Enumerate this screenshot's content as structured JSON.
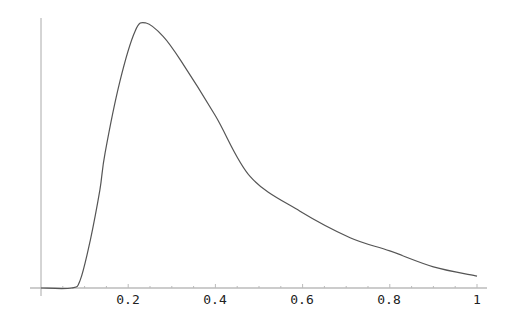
{
  "chart_data": {
    "type": "line",
    "title": "",
    "xlabel": "",
    "ylabel": "",
    "xlim": [
      0,
      1
    ],
    "ylim": [
      0,
      1
    ],
    "grid": false,
    "legend": null,
    "x_ticks": [
      "0.2",
      "0.4",
      "0.6",
      "0.8",
      "1"
    ],
    "y_ticks": [],
    "series": [
      {
        "name": "curve",
        "x": [
          0.0,
          0.07,
          0.09,
          0.113,
          0.135,
          0.147,
          0.181,
          0.216,
          0.241,
          0.28,
          0.32,
          0.4,
          0.48,
          0.594,
          0.709,
          0.8,
          0.9,
          1.0
        ],
        "y": [
          0.0,
          0.0,
          0.03,
          0.18,
          0.37,
          0.51,
          0.78,
          0.97,
          1.0,
          0.95,
          0.86,
          0.65,
          0.42,
          0.29,
          0.19,
          0.14,
          0.08,
          0.045
        ]
      }
    ]
  },
  "axis": {
    "tick_values": [
      0.2,
      0.4,
      0.6,
      0.8,
      1.0
    ],
    "tick_labels": [
      "0.2",
      "0.4",
      "0.6",
      "0.8",
      "1"
    ]
  },
  "colors": {
    "line": "#555555",
    "axis": "#888888",
    "text": "#222222"
  }
}
